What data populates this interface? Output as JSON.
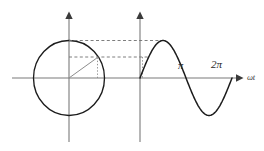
{
  "figure": {
    "background_color": "#ffffff",
    "width": 264,
    "height": 151
  },
  "labels": {
    "pi": "π",
    "two_pi": "2π",
    "omega_t": "ωt"
  },
  "colors": {
    "axis": "#7a7a7a",
    "curve": "#1c1c1c",
    "circle": "#1c1c1c",
    "radius": "#8d8d8d",
    "guide": "#6f6f6f"
  },
  "chart_data": {
    "type": "line",
    "xlabel": "ωt",
    "ylabel": "",
    "grid": false,
    "legend": null,
    "xlim": [
      0,
      6.283185
    ],
    "ylim": [
      -1,
      1
    ],
    "xticks": [
      3.141593,
      6.283185
    ],
    "xticklabels": [
      "π",
      "2π"
    ],
    "yticks": [],
    "yticklabels": [],
    "series": [
      {
        "name": "sin(ωt)",
        "x": [
          0,
          0.3927,
          0.7854,
          1.1781,
          1.5708,
          1.9635,
          2.3562,
          2.7489,
          3.141593,
          3.5343,
          3.927,
          4.3197,
          4.712389,
          5.1051,
          5.4978,
          5.8905,
          6.283185
        ],
        "y": [
          0,
          0.3827,
          0.7071,
          0.9239,
          1,
          0.9239,
          0.7071,
          0.3827,
          0,
          -0.3827,
          -0.7071,
          -0.9239,
          -1,
          -0.9239,
          -0.7071,
          -0.3827,
          0
        ]
      }
    ],
    "annotations": [
      {
        "name": "phasor-circle",
        "kind": "circle",
        "center": [
          0,
          0
        ],
        "radius": 1,
        "note": "unit circle representing the rotating phasor"
      },
      {
        "name": "phasor-radius",
        "kind": "radius",
        "angle_deg": 37,
        "note": "radius drawn from circle center to the circumference"
      },
      {
        "name": "peak-guide",
        "kind": "horizontal-dashed",
        "y": 1,
        "note": "dashed line from circle top to wave peak"
      },
      {
        "name": "phasor-projection-guide",
        "kind": "horizontal-dashed",
        "y": 0.6,
        "note": "dashed line from phasor tip across to the waveform"
      },
      {
        "name": "phasor-vertical-drop",
        "kind": "vertical-dotted",
        "note": "dotted drop from the phasor tip to the horizontal axis"
      },
      {
        "name": "wave-start-vertical-dotted",
        "kind": "vertical-dotted",
        "note": "dotted segment at the waveform origin"
      }
    ]
  }
}
